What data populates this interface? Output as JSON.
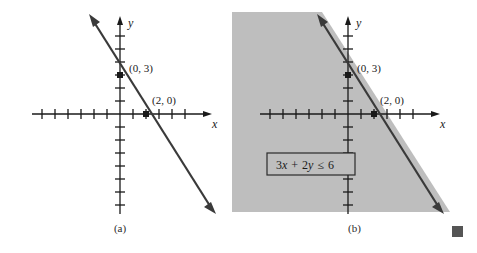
{
  "figure": {
    "end_marker": "end-of-example-square"
  },
  "panels": [
    {
      "id": "a",
      "caption": "(a)",
      "shaded": false,
      "axes": {
        "x_label": "x",
        "y_label": "y",
        "origin": {
          "x": 120,
          "y": 114
        },
        "tick_spacing": 13,
        "x_ticks_negative": 6,
        "x_ticks_positive": 5,
        "y_ticks_positive": 6,
        "y_ticks_negative": 7,
        "x_axis_start": 32,
        "x_axis_end": 212,
        "y_axis_top": 16,
        "y_axis_bottom": 214
      },
      "line": {
        "equation": "3x + 2y = 6",
        "slope": -1.5,
        "y_intercept": 3,
        "x_intercept": 2,
        "style": "solid",
        "arrow_start": true,
        "arrow_end": true,
        "p1": {
          "x": 90,
          "y": 16
        },
        "p2": {
          "x": 215,
          "y": 212
        }
      },
      "points": [
        {
          "label": "(0, 3)",
          "x": 0,
          "y": 3,
          "px": 120,
          "py": 75,
          "label_px": 129,
          "label_py": 68
        },
        {
          "label": "(2, 0)",
          "x": 2,
          "y": 0,
          "px": 146,
          "py": 114,
          "label_px": 152,
          "label_py": 101
        }
      ]
    },
    {
      "id": "b",
      "caption": "(b)",
      "shaded": true,
      "axes": {
        "x_label": "x",
        "y_label": "y",
        "origin": {
          "x": 116,
          "y": 114
        },
        "tick_spacing": 13,
        "x_ticks_negative": 6,
        "x_ticks_positive": 5,
        "y_ticks_positive": 6,
        "y_ticks_negative": 7,
        "x_axis_start": 28,
        "x_axis_end": 208,
        "y_axis_top": 16,
        "y_axis_bottom": 214
      },
      "line": {
        "equation": "3x + 2y = 6",
        "slope": -1.5,
        "y_intercept": 3,
        "x_intercept": 2,
        "style": "solid",
        "arrow_start": true,
        "arrow_end": true,
        "p1": {
          "x": 86,
          "y": 16
        },
        "p2": {
          "x": 211,
          "y": 212
        }
      },
      "points": [
        {
          "label": "(0, 3)",
          "x": 0,
          "y": 3,
          "px": 116,
          "py": 75,
          "label_px": 125,
          "label_py": 68
        },
        {
          "label": "(2, 0)",
          "x": 2,
          "y": 0,
          "px": 142,
          "py": 114,
          "label_px": 148,
          "label_py": 101
        }
      ],
      "region": {
        "fill_color": "#bebebe",
        "description": "half-plane below and left of the boundary line",
        "bounds": {
          "left": 0,
          "top": 12,
          "right": 218,
          "bottom": 212
        }
      },
      "inequality_box": {
        "full_text": "3x + 2y ≤ 6",
        "coef_x": "3",
        "var_x": "x",
        "operator_plus": "+",
        "coef_y": "2",
        "var_y": "y",
        "relation": "≤",
        "constant": "6",
        "box_x": 35,
        "box_y": 153,
        "box_w": 88,
        "box_h": 22
      }
    }
  ],
  "colors": {
    "axis": "#1a1a1a",
    "line": "#3a3a3a",
    "shading": "#bebebe",
    "text": "#1a1a1a",
    "end_marker": "#555555",
    "background": "#ffffff"
  }
}
